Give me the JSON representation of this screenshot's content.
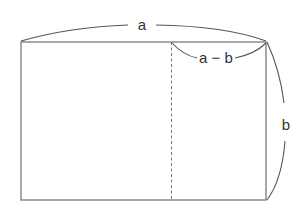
{
  "diagram": {
    "title": "",
    "colors": {
      "stroke": "#7a7a7a",
      "brace": "#555555",
      "text": "#333333",
      "background": "#ffffff"
    },
    "rectangle": {
      "x1": 21,
      "y1": 42,
      "x2": 266,
      "y2": 200
    },
    "divider": {
      "x": 171,
      "style": "dashed"
    },
    "labels": {
      "top_width": "a",
      "right_segment": "a − b",
      "right_height": "b"
    }
  }
}
